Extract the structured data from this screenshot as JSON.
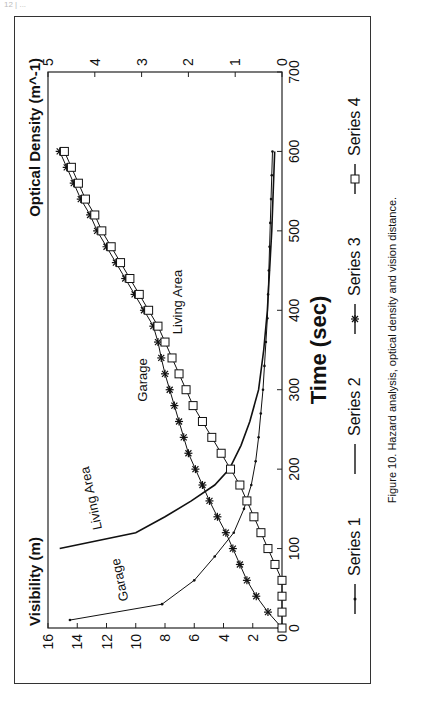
{
  "page": {
    "top_note": "12 | ..."
  },
  "figure": {
    "caption": "Figure 10.  Hazard analysis, optical density and vision distance."
  },
  "chart_data": {
    "type": "line",
    "title": "",
    "xlabel": "Time (sec)",
    "ylabel": "Visibility (m)",
    "y2label": "Optical Density (m^-1)",
    "xlim": [
      0,
      700
    ],
    "ylim": [
      0,
      16
    ],
    "y2lim": [
      0,
      5
    ],
    "xticks": [
      0,
      100,
      200,
      300,
      400,
      500,
      600,
      700
    ],
    "yticks": [
      0,
      2,
      4,
      6,
      8,
      10,
      12,
      14,
      16
    ],
    "y2ticks": [
      0,
      1,
      2,
      3,
      4,
      5
    ],
    "grid": false,
    "legend_position": "bottom",
    "annotations": [
      {
        "text": "Garage",
        "near": "Series 1"
      },
      {
        "text": "Living Area",
        "near": "Series 2"
      },
      {
        "text": "Garage",
        "near": "Series 3"
      },
      {
        "text": "Living Area",
        "near": "Series 4"
      }
    ],
    "series": [
      {
        "name": "Series 1",
        "label": "Garage visibility",
        "axis": "left",
        "marker": "dot",
        "x": [
          10,
          30,
          60,
          90,
          120,
          150,
          180,
          210,
          240,
          270,
          300,
          330,
          360,
          390,
          420,
          450,
          480,
          510,
          540,
          570,
          600
        ],
        "values": [
          14.5,
          8.2,
          6.0,
          4.6,
          3.3,
          2.6,
          2.1,
          1.8,
          1.6,
          1.45,
          1.3,
          1.2,
          1.1,
          1.0,
          0.95,
          0.9,
          0.85,
          0.8,
          0.75,
          0.7,
          0.65
        ]
      },
      {
        "name": "Series 2",
        "label": "Living Area visibility",
        "axis": "left",
        "marker": "none",
        "x": [
          100,
          120,
          140,
          160,
          180,
          200,
          230,
          260,
          300,
          350,
          400,
          450,
          500,
          550,
          600
        ],
        "values": [
          15.2,
          10.0,
          8.0,
          6.2,
          4.6,
          3.6,
          2.8,
          2.2,
          1.6,
          1.25,
          1.0,
          0.85,
          0.7,
          0.6,
          0.5
        ]
      },
      {
        "name": "Series 3",
        "label": "Garage optical density",
        "axis": "right",
        "marker": "asterisk",
        "x": [
          0,
          20,
          40,
          60,
          80,
          100,
          120,
          140,
          160,
          180,
          200,
          220,
          240,
          260,
          280,
          300,
          320,
          340,
          360,
          380,
          400,
          420,
          440,
          460,
          480,
          500,
          520,
          540,
          560,
          580,
          600
        ],
        "values": [
          0,
          0.3,
          0.55,
          0.75,
          0.9,
          1.05,
          1.2,
          1.38,
          1.55,
          1.7,
          1.85,
          2.0,
          2.1,
          2.2,
          2.3,
          2.4,
          2.5,
          2.58,
          2.65,
          2.75,
          2.95,
          3.15,
          3.35,
          3.55,
          3.75,
          3.95,
          4.1,
          4.3,
          4.45,
          4.6,
          4.75
        ]
      },
      {
        "name": "Series 4",
        "label": "Living Area optical density",
        "axis": "right",
        "marker": "square",
        "x": [
          0,
          20,
          40,
          60,
          80,
          100,
          120,
          140,
          160,
          180,
          200,
          220,
          240,
          260,
          280,
          300,
          320,
          340,
          360,
          380,
          400,
          420,
          440,
          460,
          480,
          500,
          520,
          540,
          560,
          580,
          600
        ],
        "values": [
          0,
          0,
          0,
          0,
          0.15,
          0.3,
          0.45,
          0.6,
          0.75,
          0.9,
          1.1,
          1.3,
          1.5,
          1.7,
          1.9,
          2.05,
          2.2,
          2.35,
          2.5,
          2.65,
          2.85,
          3.05,
          3.25,
          3.45,
          3.65,
          3.85,
          4.0,
          4.2,
          4.35,
          4.5,
          4.65
        ]
      }
    ]
  }
}
